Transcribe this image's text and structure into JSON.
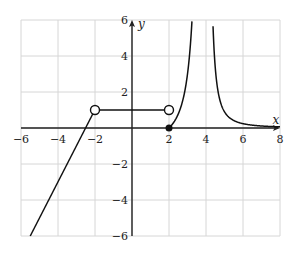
{
  "chart_data": {
    "type": "line",
    "title": "",
    "xlabel": "x",
    "ylabel": "y",
    "xlim": [
      -6,
      8
    ],
    "ylim": [
      -6,
      6
    ],
    "grid": true,
    "grid_step": 2,
    "x_ticks": [
      "-6",
      "-4",
      "-2",
      "2",
      "4",
      "6",
      "8"
    ],
    "y_ticks": [
      "6",
      "4",
      "2",
      "-2",
      "-4",
      "-6"
    ],
    "series": [
      {
        "name": "linear piece",
        "kind": "segment",
        "points": [
          [
            -5.5,
            -6
          ],
          [
            -2,
            1
          ]
        ],
        "end_marker": "open"
      },
      {
        "name": "constant piece",
        "kind": "segment",
        "points": [
          [
            -2,
            1
          ],
          [
            2,
            1
          ]
        ],
        "start_marker": "open",
        "end_marker": "open"
      },
      {
        "name": "point at 2",
        "kind": "point",
        "points": [
          [
            2,
            0
          ]
        ],
        "marker": "filled"
      },
      {
        "name": "rational piece left",
        "kind": "curve",
        "domain": [
          2,
          3.9
        ],
        "asymptote_x": 4
      },
      {
        "name": "rational piece right",
        "kind": "curve",
        "domain": [
          4.1,
          8
        ],
        "asymptote_x": 4,
        "horizontal_asymptote_y": 0
      }
    ],
    "annotations": {
      "vertical_asymptote": 4
    }
  },
  "labels": {
    "x_axis": "x",
    "y_axis": "y",
    "xticks": [
      {
        "v": -6,
        "t": "−6"
      },
      {
        "v": -4,
        "t": "−4"
      },
      {
        "v": -2,
        "t": "−2"
      },
      {
        "v": 2,
        "t": "2"
      },
      {
        "v": 4,
        "t": "4"
      },
      {
        "v": 6,
        "t": "6"
      },
      {
        "v": 8,
        "t": "8"
      }
    ],
    "yticks": [
      {
        "v": 6,
        "t": "6"
      },
      {
        "v": 4,
        "t": "4"
      },
      {
        "v": 2,
        "t": "2"
      },
      {
        "v": -2,
        "t": "−2"
      },
      {
        "v": -4,
        "t": "−4"
      },
      {
        "v": -6,
        "t": "−6"
      }
    ]
  }
}
